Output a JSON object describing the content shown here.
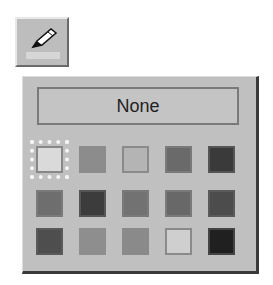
{
  "toolbar": {
    "pen_button": {
      "icon": "pencil-icon",
      "tooltip": ""
    },
    "current_color": "#d6d6d6"
  },
  "palette": {
    "none_label": "None",
    "selected_index": 0,
    "swatches": [
      {
        "color": "#dadada",
        "border": "#888888"
      },
      {
        "color": "#8c8c8c",
        "border": "#8c8c8c"
      },
      {
        "color": "#b4b4b4",
        "border": "#8a8a8a"
      },
      {
        "color": "#6a6a6a",
        "border": "#7a7a7a"
      },
      {
        "color": "#3a3a3a",
        "border": "#555555"
      },
      {
        "color": "#6e6e6e",
        "border": "#7a7a7a"
      },
      {
        "color": "#3c3c3c",
        "border": "#555555"
      },
      {
        "color": "#727272",
        "border": "#7a7a7a"
      },
      {
        "color": "#686868",
        "border": "#7a7a7a"
      },
      {
        "color": "#4c4c4c",
        "border": "#5a5a5a"
      },
      {
        "color": "#4e4e4e",
        "border": "#5a5a5a"
      },
      {
        "color": "#8e8e8e",
        "border": "#8e8e8e"
      },
      {
        "color": "#8a8a8a",
        "border": "#8a8a8a"
      },
      {
        "color": "#cfcfcf",
        "border": "#8a8a8a"
      },
      {
        "color": "#202020",
        "border": "#444444"
      }
    ]
  }
}
